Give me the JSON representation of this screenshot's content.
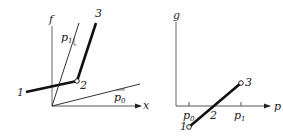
{
  "left_panel": {
    "y_axis_label": "f",
    "x_axis_label": "x",
    "slope_labels": [
      {
        "base": "p",
        "sub": "1"
      },
      {
        "base": "p",
        "sub": "0"
      }
    ],
    "points": [
      "1",
      "2",
      "3"
    ]
  },
  "right_panel": {
    "y_axis_label": "g",
    "x_axis_label": "p",
    "ticks": [
      {
        "base": "p",
        "sub": "0"
      },
      {
        "base": "p",
        "sub": "1"
      }
    ],
    "crossing_label": "2",
    "points": [
      "1",
      "3"
    ]
  },
  "colors": {
    "ink": "#222222",
    "background": "#ffffff"
  }
}
